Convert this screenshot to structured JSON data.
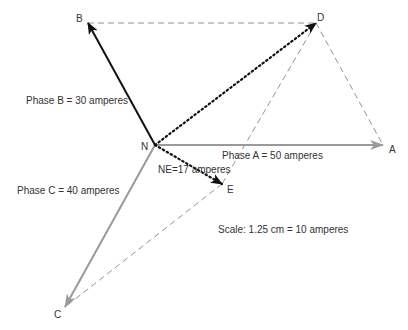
{
  "diagram": {
    "title": "",
    "points": {
      "N": {
        "label": "N",
        "x": 155,
        "y": 145
      },
      "A": {
        "label": "A",
        "x": 383,
        "y": 145
      },
      "B": {
        "label": "B",
        "x": 88,
        "y": 23
      },
      "C": {
        "label": "C",
        "x": 65,
        "y": 307
      },
      "D": {
        "label": "D",
        "x": 316,
        "y": 23
      },
      "E": {
        "label": "E",
        "x": 222,
        "y": 184
      }
    },
    "vectors": {
      "phase_a": {
        "label": "Phase A = 50 amperes",
        "from": "N",
        "to": "A",
        "style": "solid-gray"
      },
      "phase_b": {
        "label": "Phase B = 30 amperes",
        "from": "N",
        "to": "B",
        "style": "solid-black"
      },
      "phase_c": {
        "label": "Phase C = 40 amperes",
        "from": "N",
        "to": "C",
        "style": "solid-gray"
      },
      "nd": {
        "label": "",
        "from": "N",
        "to": "D",
        "style": "dotted-black"
      },
      "ne": {
        "label": "NE=17 amperes",
        "from": "N",
        "to": "E",
        "style": "dotted-black"
      }
    },
    "construction_lines": [
      {
        "from": "B",
        "to": "D",
        "style": "dashed-gray"
      },
      {
        "from": "D",
        "to": "A",
        "style": "dashed-gray"
      },
      {
        "from": "D",
        "to": "E",
        "style": "dashed-gray"
      },
      {
        "from": "E",
        "to": "C",
        "style": "dashed-gray"
      }
    ],
    "scale_note": "Scale: 1.25 cm = 10 amperes",
    "colors": {
      "black_vector": "#111111",
      "gray_vector": "#9a9a9a",
      "construction": "#777777",
      "text": "#333333"
    }
  }
}
